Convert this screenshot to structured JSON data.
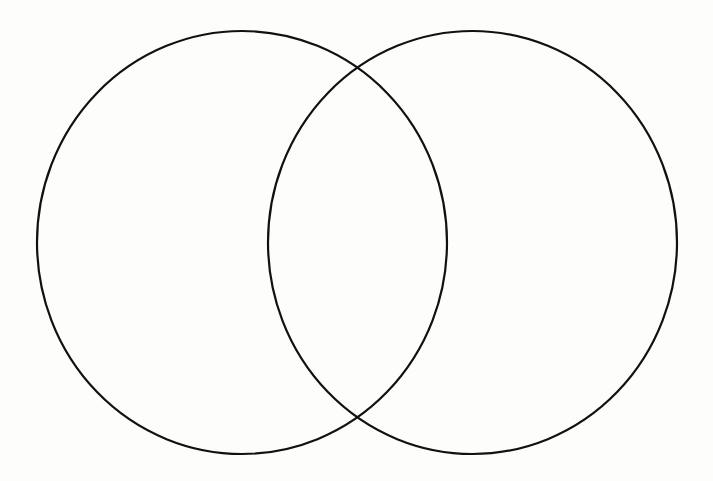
{
  "diagram": {
    "type": "venn",
    "background": "#fdfdfb",
    "stroke_color": "#111111",
    "stroke_width": 2.2,
    "circles": [
      {
        "id": "left",
        "cx": 242,
        "cy": 242.5,
        "rx": 205,
        "ry": 211.5,
        "label": ""
      },
      {
        "id": "right",
        "cx": 472.5,
        "cy": 242.5,
        "rx": 204.5,
        "ry": 211.5,
        "label": ""
      }
    ],
    "intersections": [
      {
        "x": 360,
        "y": 67
      },
      {
        "x": 360,
        "y": 417
      }
    ]
  }
}
